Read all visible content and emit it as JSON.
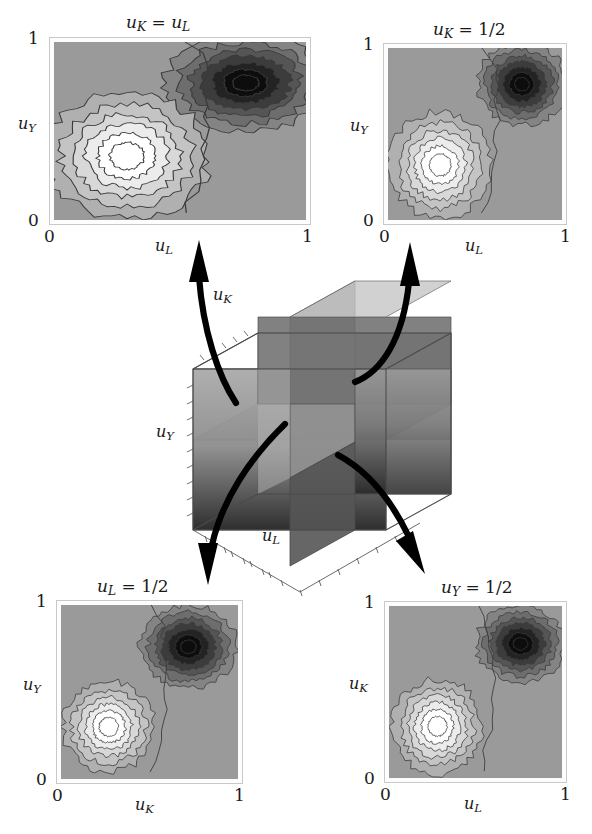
{
  "figure": {
    "domain": "scientific-contour-figure",
    "background": "#ffffff"
  },
  "panels": [
    {
      "id": "top-left",
      "title": {
        "var1": "u",
        "sub1": "K",
        "eq": " = ",
        "var2": "u",
        "sub2": "L",
        "text": "uK = uL"
      },
      "xaxis": {
        "name": "u",
        "sub": "L",
        "ticks": [
          "0",
          "1"
        ]
      },
      "yaxis": {
        "name": "u",
        "sub": "Y",
        "ticks": [
          "0",
          "1"
        ]
      }
    },
    {
      "id": "top-right",
      "title": {
        "var1": "u",
        "sub1": "K",
        "eq": " = ",
        "var2": "1/2",
        "sub2": "",
        "text": "uK = 1/2"
      },
      "xaxis": {
        "name": "u",
        "sub": "L",
        "ticks": [
          "0",
          "1"
        ]
      },
      "yaxis": {
        "name": "u",
        "sub": "Y",
        "ticks": [
          "0",
          "1"
        ]
      }
    },
    {
      "id": "bottom-left",
      "title": {
        "var1": "u",
        "sub1": "L",
        "eq": " = ",
        "var2": "1/2",
        "sub2": "",
        "text": "uL = 1/2"
      },
      "xaxis": {
        "name": "u",
        "sub": "K",
        "ticks": [
          "0",
          "1"
        ]
      },
      "yaxis": {
        "name": "u",
        "sub": "Y",
        "ticks": [
          "0",
          "1"
        ]
      }
    },
    {
      "id": "bottom-right",
      "title": {
        "var1": "u",
        "sub1": "Y",
        "eq": " = ",
        "var2": "1/2",
        "sub2": "",
        "text": "uY = 1/2"
      },
      "xaxis": {
        "name": "u",
        "sub": "L",
        "ticks": [
          "0",
          "1"
        ]
      },
      "yaxis": {
        "name": "u",
        "sub": "K",
        "ticks": [
          "0",
          "1"
        ]
      }
    }
  ],
  "cube": {
    "axis_labels": [
      {
        "name": "u",
        "sub": "K",
        "text": "uK"
      },
      {
        "name": "u",
        "sub": "Y",
        "text": "uY"
      },
      {
        "name": "u",
        "sub": "L",
        "text": "uL"
      }
    ],
    "planes": 3,
    "note": "three mutually orthogonal mid-slices inside a transparent unit cube"
  },
  "arrows": [
    {
      "id": "arrow-to-top-left",
      "from": "cube",
      "to": "top-left",
      "direction": "up-left"
    },
    {
      "id": "arrow-to-top-right",
      "from": "cube",
      "to": "top-right",
      "direction": "up-right"
    },
    {
      "id": "arrow-to-bottom-left",
      "from": "cube",
      "to": "bottom-left",
      "direction": "down-left"
    },
    {
      "id": "arrow-to-bottom-right",
      "from": "cube",
      "to": "bottom-right",
      "direction": "down-right"
    }
  ],
  "colors": {
    "background": "#9a9a9a",
    "level_light_1": "#b0b0b0",
    "level_light_2": "#c4c4c4",
    "level_light_3": "#d8d8d8",
    "level_light_4": "#ececec",
    "level_light_5": "#ffffff",
    "level_dark_1": "#848484",
    "level_dark_2": "#6d6d6d",
    "level_dark_3": "#555555",
    "level_dark_4": "#3c3c3c",
    "level_dark_5": "#232323",
    "level_dark_6": "#0d0d0d",
    "contour_line": "#3a3a3a",
    "frame": "#cfcfcf",
    "arrow": "#000000",
    "text": "#1a1a1a"
  },
  "chart_data": {
    "type": "heatmap",
    "common": {
      "xlim": [
        0,
        1
      ],
      "ylim": [
        0,
        1
      ],
      "xticks": [
        0,
        1
      ],
      "yticks": [
        0,
        1
      ],
      "grid": false,
      "legend": "none",
      "colormap": "grayscale, light = high peak A, dark = high peak B",
      "n_levels": 12
    },
    "panels": [
      {
        "id": "top-left",
        "title": "u_K = u_L",
        "xlabel": "u_L",
        "ylabel": "u_Y",
        "light_peak": {
          "cx": 0.29,
          "cy": 0.36,
          "rx": 0.2,
          "ry": 0.22,
          "peak_value": 1.0
        },
        "dark_peak": {
          "cx": 0.76,
          "cy": 0.77,
          "rx": 0.2,
          "ry": 0.17,
          "peak_value": -1.0
        },
        "saddle_x": 0.56
      },
      {
        "id": "top-right",
        "title": "u_K = 1/2",
        "xlabel": "u_L",
        "ylabel": "u_Y",
        "light_peak": {
          "cx": 0.3,
          "cy": 0.32,
          "rx": 0.18,
          "ry": 0.19,
          "peak_value": 1.0
        },
        "dark_peak": {
          "cx": 0.77,
          "cy": 0.79,
          "rx": 0.16,
          "ry": 0.15,
          "peak_value": -1.0
        },
        "saddle_x": 0.58
      },
      {
        "id": "bottom-left",
        "title": "u_L = 1/2",
        "xlabel": "u_K",
        "ylabel": "u_Y",
        "light_peak": {
          "cx": 0.27,
          "cy": 0.3,
          "rx": 0.16,
          "ry": 0.16,
          "peak_value": 1.0
        },
        "dark_peak": {
          "cx": 0.72,
          "cy": 0.76,
          "rx": 0.17,
          "ry": 0.15,
          "peak_value": -1.0
        },
        "saddle_x": 0.55
      },
      {
        "id": "bottom-right",
        "title": "u_Y = 1/2",
        "xlabel": "u_L",
        "ylabel": "u_K",
        "light_peak": {
          "cx": 0.28,
          "cy": 0.3,
          "rx": 0.16,
          "ry": 0.17,
          "peak_value": 1.0
        },
        "dark_peak": {
          "cx": 0.76,
          "cy": 0.78,
          "rx": 0.16,
          "ry": 0.14,
          "peak_value": -1.0
        },
        "saddle_x": 0.56
      }
    ]
  }
}
